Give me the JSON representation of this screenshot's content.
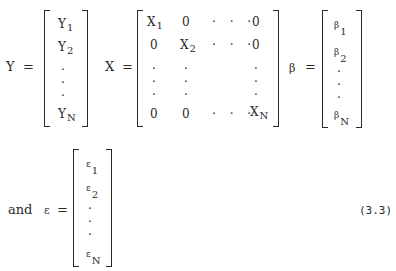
{
  "equation": {
    "number": "(3.3)",
    "connector": "and",
    "equals": "="
  },
  "Y": {
    "symbol": "Y",
    "entries": [
      {
        "base": "Y",
        "sub": "1"
      },
      {
        "base": "Y",
        "sub": "2"
      },
      {
        "base": "·",
        "sub": ""
      },
      {
        "base": "·",
        "sub": ""
      },
      {
        "base": "·",
        "sub": ""
      },
      {
        "base": "Y",
        "sub": "N"
      }
    ]
  },
  "X": {
    "symbol": "X",
    "rows": [
      [
        "X1",
        "0",
        "· · ·",
        "0"
      ],
      [
        "0",
        "X2",
        "· · ·",
        "0"
      ],
      [
        "·",
        "·",
        "",
        "·"
      ],
      [
        "·",
        "·",
        "",
        "·"
      ],
      [
        "·",
        "·",
        "",
        "·"
      ],
      [
        "0",
        "0",
        "· · ·",
        "XN"
      ]
    ],
    "diag_base": "X",
    "diag_subs": [
      "1",
      "2",
      "N"
    ],
    "zero": "0",
    "hdots": "· · ·",
    "vdot": "·"
  },
  "beta": {
    "symbol": "β",
    "entries": [
      {
        "base": "β",
        "sub": "1"
      },
      {
        "base": "β",
        "sub": "2"
      },
      {
        "base": "·",
        "sub": ""
      },
      {
        "base": "·",
        "sub": ""
      },
      {
        "base": "·",
        "sub": ""
      },
      {
        "base": "β",
        "sub": "N"
      }
    ]
  },
  "epsilon": {
    "symbol": "ε",
    "entries": [
      {
        "base": "ε",
        "sub": "1"
      },
      {
        "base": "ε",
        "sub": "2"
      },
      {
        "base": "·",
        "sub": ""
      },
      {
        "base": "·",
        "sub": ""
      },
      {
        "base": "·",
        "sub": ""
      },
      {
        "base": "ε",
        "sub": "N"
      }
    ]
  }
}
